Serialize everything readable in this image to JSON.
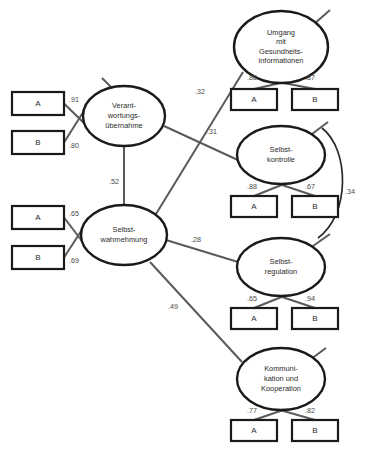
{
  "diagram": {
    "type": "structural-equation-model",
    "language": "de",
    "latents": [
      {
        "id": "verantwortungsuebernahme",
        "lines": [
          "Verant-",
          "wortungs-",
          "übernahme"
        ],
        "cx": 124,
        "cy": 116,
        "rx": 41,
        "ry": 30,
        "indicators": [
          {
            "id": "vu-a",
            "label": "A",
            "loading": ".91",
            "x": 12,
            "y": 92,
            "w": 52,
            "h": 23
          },
          {
            "id": "vu-b",
            "label": "B",
            "loading": ".80",
            "x": 12,
            "y": 131,
            "w": 52,
            "h": 23
          }
        ],
        "loading_label_positions": [
          {
            "for": "vu-a",
            "x": 74,
            "y": 100
          },
          {
            "for": "vu-b",
            "x": 74,
            "y": 146
          }
        ],
        "residual_stub": {
          "x1": 102,
          "y1": 78,
          "x2": 116,
          "y2": 92
        }
      },
      {
        "id": "selbstwahrnehmung",
        "lines": [
          "Selbst-",
          "wahrnehmung"
        ],
        "cx": 124,
        "cy": 235,
        "rx": 43,
        "ry": 30,
        "indicators": [
          {
            "id": "sw-a",
            "label": "A",
            "loading": ".65",
            "x": 12,
            "y": 206,
            "w": 52,
            "h": 23
          },
          {
            "id": "sw-b",
            "label": "B",
            "loading": ".69",
            "x": 12,
            "y": 246,
            "w": 52,
            "h": 23
          }
        ],
        "loading_label_positions": [
          {
            "for": "sw-a",
            "x": 74,
            "y": 214
          },
          {
            "for": "sw-b",
            "x": 74,
            "y": 261
          }
        ],
        "residual_stub": null
      },
      {
        "id": "umgang-gesundheitsinformationen",
        "lines": [
          "Umgang",
          "mit",
          "Gesundheits-",
          "informationen"
        ],
        "cx": 281,
        "cy": 47,
        "rx": 47,
        "ry": 36,
        "indicators": [
          {
            "id": "ug-a",
            "label": "A",
            "loading": ".88",
            "x": 231,
            "y": 89,
            "w": 46,
            "h": 21
          },
          {
            "id": "ug-b",
            "label": "B",
            "loading": ".87",
            "x": 292,
            "y": 89,
            "w": 46,
            "h": 21
          }
        ],
        "loading_label_positions": [
          {
            "for": "ug-a",
            "x": 252,
            "y": 78
          },
          {
            "for": "ug-b",
            "x": 310,
            "y": 78
          }
        ],
        "residual_stub": {
          "x1": 330,
          "y1": 10,
          "x2": 314,
          "y2": 24
        }
      },
      {
        "id": "selbstkontrolle",
        "lines": [
          "Selbst-",
          "kontrolle"
        ],
        "cx": 281,
        "cy": 155,
        "rx": 44,
        "ry": 29,
        "indicators": [
          {
            "id": "sk-a",
            "label": "A",
            "loading": ".88",
            "x": 231,
            "y": 196,
            "w": 46,
            "h": 21
          },
          {
            "id": "sk-b",
            "label": "B",
            "loading": ".67",
            "x": 292,
            "y": 196,
            "w": 46,
            "h": 21
          }
        ],
        "loading_label_positions": [
          {
            "for": "sk-a",
            "x": 252,
            "y": 187
          },
          {
            "for": "sk-b",
            "x": 310,
            "y": 187
          }
        ],
        "residual_stub": {
          "x1": 328,
          "y1": 122,
          "x2": 312,
          "y2": 134
        }
      },
      {
        "id": "selbstregulation",
        "lines": [
          "Selbst-",
          "regulation"
        ],
        "cx": 281,
        "cy": 267,
        "rx": 44,
        "ry": 29,
        "indicators": [
          {
            "id": "sr-a",
            "label": "A",
            "loading": ".65",
            "x": 231,
            "y": 308,
            "w": 46,
            "h": 21
          },
          {
            "id": "sr-b",
            "label": "B",
            "loading": ".94",
            "x": 292,
            "y": 308,
            "w": 46,
            "h": 21
          }
        ],
        "loading_label_positions": [
          {
            "for": "sr-a",
            "x": 252,
            "y": 299
          },
          {
            "for": "sr-b",
            "x": 310,
            "y": 299
          }
        ],
        "residual_stub": {
          "x1": 330,
          "y1": 234,
          "x2": 313,
          "y2": 246
        }
      },
      {
        "id": "kommunikation-kooperation",
        "lines": [
          "Kommuni-",
          "kation und",
          "Kooperation"
        ],
        "cx": 281,
        "cy": 379,
        "rx": 44,
        "ry": 31,
        "indicators": [
          {
            "id": "kk-a",
            "label": "A",
            "loading": ".77",
            "x": 231,
            "y": 420,
            "w": 46,
            "h": 21
          },
          {
            "id": "kk-b",
            "label": "B",
            "loading": ".82",
            "x": 292,
            "y": 420,
            "w": 46,
            "h": 21
          }
        ],
        "loading_label_positions": [
          {
            "for": "kk-a",
            "x": 252,
            "y": 411
          },
          {
            "for": "kk-b",
            "x": 310,
            "y": 411
          }
        ],
        "residual_stub": {
          "x1": 326,
          "y1": 348,
          "x2": 311,
          "y2": 359
        }
      }
    ],
    "structural_paths": [
      {
        "id": "path-vu-sw",
        "from": "verantwortungsuebernahme",
        "to": "selbstwahrnehmung",
        "coefficient": ".52",
        "label_x": 114,
        "label_y": 182,
        "x1": 124,
        "y1": 146,
        "x2": 124,
        "y2": 205
      },
      {
        "id": "path-sw-ug",
        "from": "selbstwahrnehmung",
        "to": "umgang-gesundheitsinformationen",
        "coefficient": ".32",
        "label_x": 200,
        "label_y": 92,
        "x1": 156,
        "y1": 214,
        "x2": 243,
        "y2": 72
      },
      {
        "id": "path-vu-sk",
        "from": "verantwortungsuebernahme",
        "to": "selbstkontrolle",
        "coefficient": ".31",
        "label_x": 212,
        "label_y": 132,
        "x1": 164,
        "y1": 126,
        "x2": 240,
        "y2": 161
      },
      {
        "id": "path-sw-sr",
        "from": "selbstwahrnehmung",
        "to": "selbstregulation",
        "coefficient": ".28",
        "label_x": 196,
        "label_y": 240,
        "x1": 166,
        "y1": 240,
        "x2": 238,
        "y2": 262
      },
      {
        "id": "path-sw-kk",
        "from": "selbstwahrnehmung",
        "to": "kommunikation-kooperation",
        "coefficient": ".49",
        "label_x": 173,
        "label_y": 307,
        "x1": 150,
        "y1": 262,
        "x2": 242,
        "y2": 362
      }
    ],
    "correlations": [
      {
        "id": "corr-selbstkontrolle-selbstregulation",
        "between": [
          "selbstkontrolle",
          "selbstregulation"
        ],
        "coefficient": ".34",
        "label_x": 350,
        "label_y": 192,
        "path": "M 322 128 C 350 150, 350 215, 318 238"
      }
    ]
  }
}
